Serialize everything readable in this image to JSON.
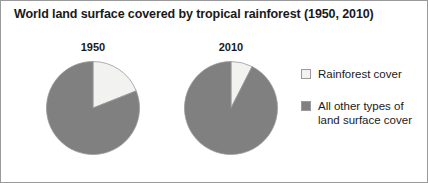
{
  "chart_data": {
    "type": "pie",
    "title": "World land surface covered by tropical rainforest (1950, 2010)",
    "xlabel": "",
    "ylabel": "",
    "legend_position": "right",
    "grid": false,
    "categories": [
      "Rainforest cover",
      "All other types of land surface cover"
    ],
    "colors": {
      "rainforest_cover": "#f2f2f0",
      "other_land_surface": "#808080",
      "outline": "#9a9a9a",
      "title_text": "#1a1a1a"
    },
    "charts": [
      {
        "label": "1950",
        "slices": [
          {
            "name": "Rainforest cover",
            "value": 19,
            "unit": "%",
            "color": "#f2f2f0"
          },
          {
            "name": "All other types of land surface cover",
            "value": 81,
            "unit": "%",
            "color": "#808080"
          }
        ]
      },
      {
        "label": "2010",
        "slices": [
          {
            "name": "Rainforest cover",
            "value": 7.5,
            "unit": "%",
            "color": "#f2f2f0"
          },
          {
            "name": "All other types of land surface cover",
            "value": 92.5,
            "unit": "%",
            "color": "#808080"
          }
        ]
      }
    ]
  },
  "legend": {
    "items": [
      {
        "label": "Rainforest cover",
        "color": "#f2f2f0"
      },
      {
        "label": "All other types of land surface cover",
        "color": "#808080"
      }
    ]
  }
}
